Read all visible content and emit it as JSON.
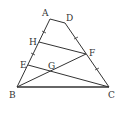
{
  "diagram": {
    "type": "geometry-figure",
    "points": {
      "A": {
        "label": "A",
        "x": 50,
        "y": 19
      },
      "D": {
        "label": "D",
        "x": 65,
        "y": 23
      },
      "H": {
        "label": "H",
        "x": 39,
        "y": 42
      },
      "F": {
        "label": "F",
        "x": 86,
        "y": 54
      },
      "E": {
        "label": "E",
        "x": 28,
        "y": 65
      },
      "G": {
        "label": "G",
        "x": 52,
        "y": 71
      },
      "B": {
        "label": "B",
        "x": 17,
        "y": 87
      },
      "C": {
        "label": "C",
        "x": 109,
        "y": 87
      }
    },
    "segments": [
      [
        "A",
        "D"
      ],
      [
        "A",
        "B"
      ],
      [
        "D",
        "C"
      ],
      [
        "B",
        "C"
      ],
      [
        "H",
        "F"
      ],
      [
        "E",
        "C"
      ],
      [
        "B",
        "F"
      ]
    ],
    "tick_marks": [
      "AH",
      "HE",
      "DF",
      "FC"
    ]
  },
  "labels": {
    "A": "A",
    "D": "D",
    "H": "H",
    "F": "F",
    "E": "E",
    "G": "G",
    "B": "B",
    "C": "C"
  },
  "colors": {
    "stroke": "#333333",
    "background": "#ffffff"
  }
}
